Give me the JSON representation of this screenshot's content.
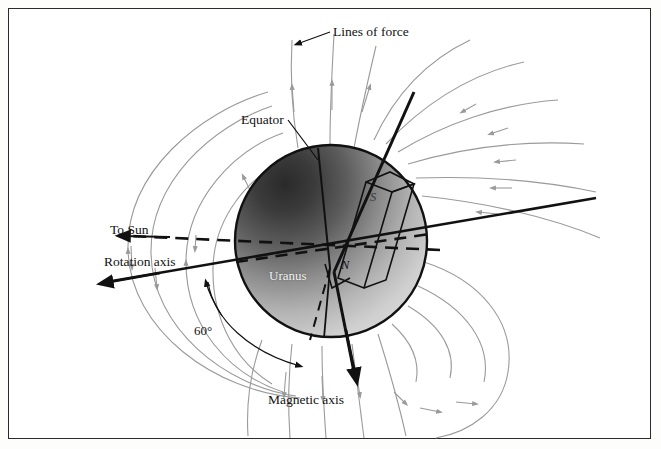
{
  "figure": {
    "background_color": "#ffffff",
    "border_color": "#2b2b2b"
  },
  "labels": {
    "lines_of_force": "Lines of force",
    "equator": "Equator",
    "to_sun": "To Sun",
    "rotation_axis": "Rotation axis",
    "planet": "Uranus",
    "tilt_angle": "60°",
    "magnetic_axis": "Magnetic axis",
    "north_pole": "N",
    "south_pole": "S"
  },
  "planet": {
    "name": "Uranus",
    "center_x": 331,
    "center_y": 241,
    "radius": 96,
    "outline_color": "#111111",
    "shading": "dark upper-left to light lower-right"
  },
  "axes": {
    "rotation_axis": {
      "label": "Rotation axis",
      "style": "solid",
      "arrow_end": "left",
      "color": "#111111"
    },
    "magnetic_axis": {
      "label": "Magnetic axis",
      "style": "solid",
      "arrow_end": "bottom",
      "color": "#111111",
      "tilt_from_rotation_axis_degrees": 60
    },
    "equator": {
      "label": "Equator",
      "style": "dashed",
      "color": "#111111"
    },
    "to_sun": {
      "label": "To Sun",
      "style": "dashed",
      "arrow_end": "left",
      "color": "#111111"
    }
  },
  "field_lines": {
    "label": "Lines of force",
    "color": "#9a9a9a",
    "arrow_color": "#9a9a9a",
    "count": 16
  },
  "bar_magnet": {
    "north_label": "N",
    "south_label": "S",
    "outline_color": "#111111"
  }
}
